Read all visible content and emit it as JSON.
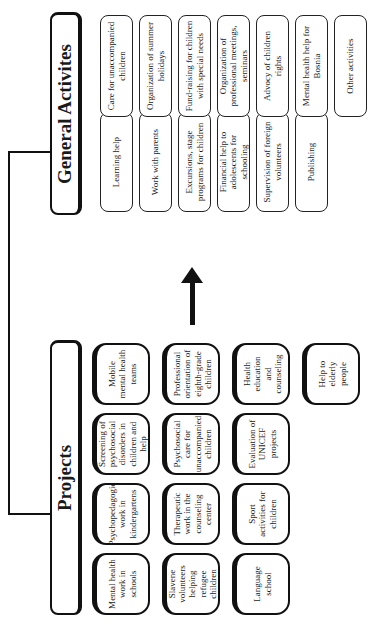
{
  "diagram": {
    "headers": {
      "projects": "Projects",
      "general": "General Activites"
    },
    "projects": [
      [
        "Mobile mental health teams",
        "Screening of psychosocial disorders in children and help",
        "Psychopedagogic work in kindergartens",
        "Mental health work in schools"
      ],
      [
        "Professional orientation of eighth-grade children",
        "Psychosocial care for unaccompanied children",
        "Therapeutic work in the counseling center",
        "Slavene volunteers helping refugee children"
      ],
      [
        "Health education and counseling",
        "Evaluation of UNICEF projects",
        "Sport activities for children",
        "Language school"
      ],
      [
        "Help to elderly people"
      ]
    ],
    "general_left": [
      "Learning help",
      "Work with parents",
      "Excursions, stage programs for children",
      "Financial help to adolescents for schooling",
      "Supervision of foreign volunteers",
      "Publishing"
    ],
    "general_right": [
      "Care for unaccompanied children",
      "Organization of summer holidays",
      "Fund-raising for children with special needs",
      "Organization of professional meetings, seminars",
      "Advocy of children rights",
      "Mental health help for Bosnia",
      "Other activities"
    ],
    "arrow_direction": "projects-to-general-activities"
  }
}
